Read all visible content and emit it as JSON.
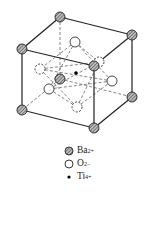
{
  "diagram": {
    "legend": [
      {
        "symbol": "hatched-circle",
        "label": "Ba",
        "charge": "2+"
      },
      {
        "symbol": "open-circle",
        "label": "O",
        "charge": "2−"
      },
      {
        "symbol": "dot",
        "label": "Ti",
        "charge": "4+"
      }
    ]
  }
}
